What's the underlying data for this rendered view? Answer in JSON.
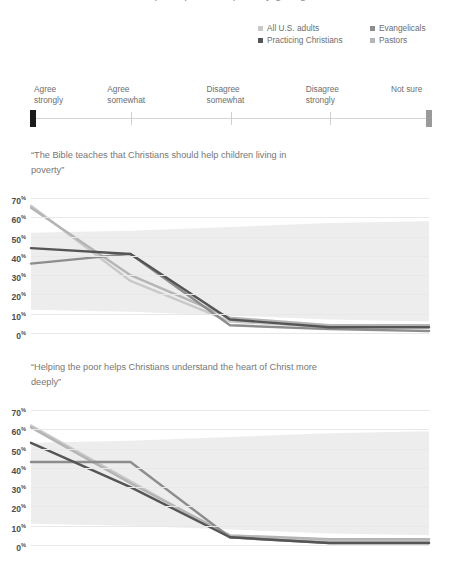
{
  "header": {
    "cut_title": "perceptions of poverty giving"
  },
  "legend": {
    "items": [
      {
        "label": "All U.S. adults",
        "color": "#c9c9c9"
      },
      {
        "label": "Evangelicals",
        "color": "#8d8d8d"
      },
      {
        "label": "Practicing Christians",
        "color": "#555555"
      },
      {
        "label": "Pastors",
        "color": "#b5b5b5"
      }
    ]
  },
  "scale": {
    "categories": [
      "Agree\nstrongly",
      "Agree\nsomewhat",
      "Disagree\nsomewhat",
      "Disagree\nstrongly",
      "Not sure"
    ],
    "left_cap_color": "#1b1b1b",
    "right_cap_color": "#9a9a9a"
  },
  "chart_data": [
    {
      "type": "line",
      "title": "“The Bible teaches that Christians should help children living in poverty”",
      "categories": [
        "Agree strongly",
        "Agree somewhat",
        "Disagree somewhat",
        "Disagree strongly",
        "Not sure"
      ],
      "xlabel": "",
      "ylabel": "",
      "ylim": [
        0,
        70
      ],
      "ytick_labels": [
        "70%",
        "60%",
        "50%",
        "40%",
        "30%",
        "20%",
        "10%",
        "0%"
      ],
      "grid": true,
      "legend_position": "top-right",
      "band": {
        "name": "range band",
        "upper": [
          52,
          53,
          55,
          57,
          58
        ],
        "lower": [
          12,
          11,
          9,
          7,
          6
        ],
        "color": "#ededed"
      },
      "series": [
        {
          "name": "All U.S. adults",
          "color": "#c9c9c9",
          "values": [
            66,
            27,
            6,
            3,
            3
          ]
        },
        {
          "name": "Practicing Christians",
          "color": "#555555",
          "values": [
            44,
            41,
            7,
            3,
            3
          ]
        },
        {
          "name": "Evangelicals",
          "color": "#8d8d8d",
          "values": [
            36,
            41,
            4,
            2,
            1
          ]
        },
        {
          "name": "Pastors",
          "color": "#b5b5b5",
          "values": [
            65,
            30,
            8,
            4,
            4
          ]
        }
      ]
    },
    {
      "type": "line",
      "title": "“Helping the poor helps Christians understand the heart of Christ more deeply”",
      "categories": [
        "Agree strongly",
        "Agree somewhat",
        "Disagree somewhat",
        "Disagree strongly",
        "Not sure"
      ],
      "xlabel": "",
      "ylabel": "",
      "ylim": [
        0,
        70
      ],
      "ytick_labels": [
        "70%",
        "60%",
        "50%",
        "40%",
        "30%",
        "20%",
        "10%",
        "0%"
      ],
      "grid": true,
      "legend_position": "top-right",
      "band": {
        "name": "range band",
        "upper": [
          53,
          54,
          56,
          58,
          59
        ],
        "lower": [
          11,
          10,
          8,
          6,
          5
        ],
        "color": "#ededed"
      },
      "series": [
        {
          "name": "All U.S. adults",
          "color": "#c9c9c9",
          "values": [
            62,
            33,
            4,
            2,
            2
          ]
        },
        {
          "name": "Practicing Christians",
          "color": "#555555",
          "values": [
            53,
            30,
            4,
            1,
            1
          ]
        },
        {
          "name": "Evangelicals",
          "color": "#8d8d8d",
          "values": [
            43,
            43,
            4,
            1,
            1
          ]
        },
        {
          "name": "Pastors",
          "color": "#b5b5b5",
          "values": [
            61,
            32,
            5,
            3,
            3
          ]
        }
      ]
    }
  ]
}
